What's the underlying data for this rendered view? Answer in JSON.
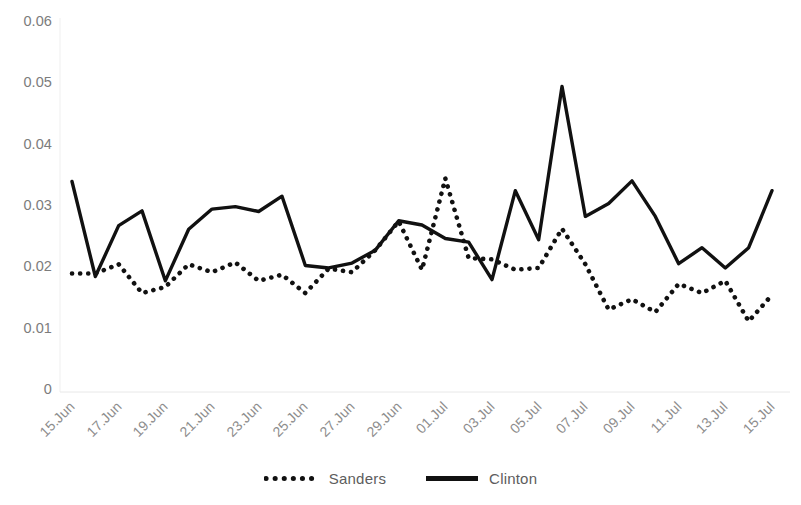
{
  "chart_data": {
    "type": "line",
    "title": "",
    "xlabel": "",
    "ylabel": "",
    "ylim": [
      0,
      0.06
    ],
    "grid": false,
    "legend_position": "bottom",
    "y_ticks": [
      "0",
      "0.01",
      "0.02",
      "0.03",
      "0.04",
      "0.05",
      "0.06"
    ],
    "y_tick_values": [
      0,
      0.01,
      0.02,
      0.03,
      0.04,
      0.05,
      0.06
    ],
    "x_tick_labels": [
      "15.Jun",
      "17.Jun",
      "19.Jun",
      "21.Jun",
      "23.Jun",
      "25.Jun",
      "27.Jun",
      "29.Jun",
      "01.Jul",
      "03.Jul",
      "05.Jul",
      "07.Jul",
      "09.Jul",
      "11.Jul",
      "13.Jul",
      "15.Jul"
    ],
    "x": [
      "15.Jun",
      "16.Jun",
      "17.Jun",
      "18.Jun",
      "19.Jun",
      "20.Jun",
      "21.Jun",
      "22.Jun",
      "23.Jun",
      "24.Jun",
      "25.Jun",
      "26.Jun",
      "27.Jun",
      "28.Jun",
      "29.Jun",
      "30.Jun",
      "01.Jul",
      "02.Jul",
      "03.Jul",
      "04.Jul",
      "05.Jul",
      "06.Jul",
      "07.Jul",
      "08.Jul",
      "09.Jul",
      "10.Jul",
      "11.Jul",
      "12.Jul",
      "13.Jul",
      "14.Jul",
      "15.Jul"
    ],
    "series": [
      {
        "name": "Sanders",
        "style": "dotted",
        "color": "#111111",
        "values": [
          0.019,
          0.019,
          0.0205,
          0.0158,
          0.0168,
          0.0205,
          0.0192,
          0.0208,
          0.0178,
          0.0188,
          0.0158,
          0.0198,
          0.0192,
          0.0228,
          0.0275,
          0.0196,
          0.0345,
          0.0215,
          0.0213,
          0.0196,
          0.0199,
          0.0263,
          0.0205,
          0.0131,
          0.0148,
          0.0127,
          0.0173,
          0.0158,
          0.0178,
          0.0112,
          0.0155
        ]
      },
      {
        "name": "Clinton",
        "style": "solid",
        "color": "#111111",
        "values": [
          0.034,
          0.0185,
          0.0268,
          0.0292,
          0.0178,
          0.0262,
          0.0295,
          0.0299,
          0.0291,
          0.0316,
          0.0203,
          0.0199,
          0.0207,
          0.0228,
          0.0276,
          0.0269,
          0.0247,
          0.0241,
          0.018,
          0.0325,
          0.0245,
          0.0495,
          0.0283,
          0.0304,
          0.0341,
          0.0283,
          0.0206,
          0.0232,
          0.0199,
          0.0232,
          0.0325
        ]
      }
    ]
  },
  "legend": {
    "entries": [
      {
        "label": "Sanders",
        "style": "dotted"
      },
      {
        "label": "Clinton",
        "style": "solid"
      }
    ]
  }
}
